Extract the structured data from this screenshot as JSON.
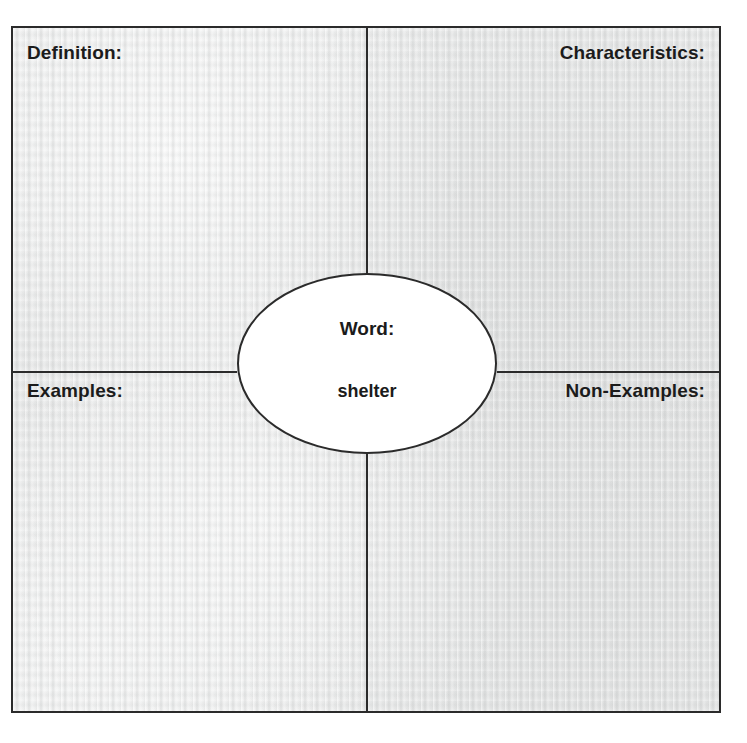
{
  "worksheet": {
    "type": "frayer-model-graphic-organizer",
    "quadrants": {
      "top_left_label": "Definition:",
      "top_right_label": "Characteristics:",
      "bottom_left_label": "Examples:",
      "bottom_right_label": "Non-Examples:"
    },
    "center": {
      "word_label": "Word:",
      "word_value": "shelter"
    },
    "colors": {
      "paper": "#e7e8e8",
      "ink": "#1b1b1b",
      "line": "#2b2b2b",
      "oval_fill": "#ffffff"
    }
  }
}
